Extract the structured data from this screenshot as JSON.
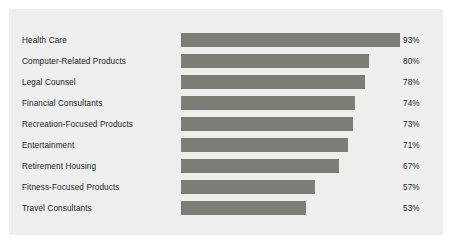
{
  "chart_data": {
    "type": "bar",
    "orientation": "horizontal",
    "title": "",
    "subtitle": "",
    "xlabel": "",
    "ylabel": "",
    "grid": false,
    "legend": null,
    "xlim": [
      0,
      100
    ],
    "value_suffix": "%",
    "categories": [
      "Health Care",
      "Computer-Related Products",
      "Legal Counsel",
      "Financial Consultants",
      "Recreation-Focused Products",
      "Entertainment",
      "Retirement Housing",
      "Fitness-Focused Products",
      "Travel Consultants"
    ],
    "values": [
      93,
      80,
      78,
      74,
      73,
      71,
      67,
      57,
      53
    ],
    "value_labels": [
      "93%",
      "80%",
      "78%",
      "74%",
      "73%",
      "71%",
      "67%",
      "57%",
      "53%"
    ],
    "colors": {
      "bar": "#7d7d78",
      "panel_background": "#eeeeee",
      "page_background": "#ffffff",
      "text": "#1c1c1c"
    }
  },
  "rows": [
    {
      "label": "Health Care",
      "value": 93,
      "value_label": "93%"
    },
    {
      "label": "Computer-Related Products",
      "value": 80,
      "value_label": "80%"
    },
    {
      "label": "Legal Counsel",
      "value": 78,
      "value_label": "78%"
    },
    {
      "label": "Financial Consultants",
      "value": 74,
      "value_label": "74%"
    },
    {
      "label": "Recreation-Focused Products",
      "value": 73,
      "value_label": "73%"
    },
    {
      "label": "Entertainment",
      "value": 71,
      "value_label": "71%"
    },
    {
      "label": "Retirement Housing",
      "value": 67,
      "value_label": "67%"
    },
    {
      "label": "Fitness-Focused Products",
      "value": 57,
      "value_label": "57%"
    },
    {
      "label": "Travel Consultants",
      "value": 53,
      "value_label": "53%"
    }
  ]
}
